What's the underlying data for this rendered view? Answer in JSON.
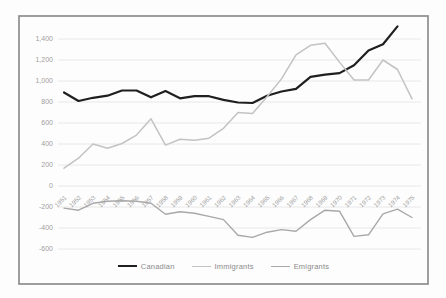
{
  "figure": {
    "background": "#fdfdfd",
    "frame_border_color": "#8d8d8d"
  },
  "chart_data": {
    "type": "line",
    "title": "",
    "xlabel": "",
    "ylabel": "",
    "categories": [
      "1951",
      "1952",
      "1953",
      "1954",
      "1955",
      "1956",
      "1957",
      "1958",
      "1959",
      "1960",
      "1961",
      "1962",
      "1963",
      "1964",
      "1965",
      "1966",
      "1967",
      "1968",
      "1969",
      "1970",
      "1971",
      "1972",
      "1973",
      "1974",
      "1975"
    ],
    "series": [
      {
        "name": "Canadian",
        "color": "#1f1f1f",
        "stroke_width": 2.2,
        "values": [
          890,
          810,
          840,
          860,
          910,
          910,
          845,
          905,
          835,
          855,
          855,
          820,
          795,
          790,
          860,
          900,
          925,
          1040,
          1060,
          1075,
          1150,
          1290,
          1350,
          1520,
          null
        ]
      },
      {
        "name": "Immigrants",
        "color": "#c3c3c3",
        "stroke_width": 1.5,
        "values": [
          170,
          265,
          400,
          360,
          405,
          485,
          640,
          390,
          445,
          435,
          455,
          550,
          700,
          690,
          850,
          1020,
          1250,
          1340,
          1360,
          1180,
          1010,
          1010,
          1200,
          1110,
          830
        ]
      },
      {
        "name": "Emigrants",
        "color": "#a8a8a8",
        "stroke_width": 1.4,
        "values": [
          -210,
          -230,
          -165,
          -145,
          -140,
          -145,
          -165,
          -270,
          -245,
          -260,
          -290,
          -320,
          -470,
          -490,
          -440,
          -415,
          -430,
          -320,
          -230,
          -240,
          -480,
          -465,
          -265,
          -220,
          -300
        ]
      }
    ],
    "ylim": [
      -600,
      1400
    ],
    "ytick_step": 200,
    "ytick_labels": [
      "1,400",
      "1,200",
      "1,000",
      "800",
      "600",
      "400",
      "200",
      "0",
      "-200",
      "-400",
      "-600"
    ],
    "grid": true,
    "gridline_color": "#e8e8e8",
    "axis_label_color": "#9d9d9d",
    "legend_position": "bottom",
    "legend": [
      "Canadian",
      "Immigrants",
      "Emigrants"
    ]
  }
}
